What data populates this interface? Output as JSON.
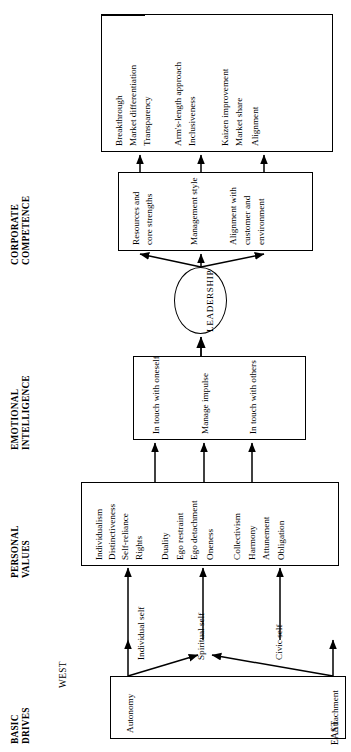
{
  "diagram": {
    "orientation": "rotated-90",
    "sections": [
      {
        "id": "corporate-competence",
        "label": "CORPORATE\nCOMPETENCE"
      },
      {
        "id": "emotional-intelligence",
        "label": "EMOTIONAL\nINTELLIGENCE"
      },
      {
        "id": "personal-values",
        "label": "PERSONAL\nVALUES"
      },
      {
        "id": "basic-drives",
        "label": "BASIC\nDRIVES"
      }
    ],
    "section_labels": {
      "corporate_competence_line1": "CORPORATE",
      "corporate_competence_line2": "COMPETENCE",
      "emotional_intelligence_line1": "EMOTIONAL",
      "emotional_intelligence_line2": "INTELLIGENCE",
      "personal_values_line1": "PERSONAL",
      "personal_values_line2": "VALUES",
      "basic_drives_line1": "BASIC",
      "basic_drives_line2": "DRIVES"
    },
    "orientation_labels": {
      "west": "WEST",
      "east": "EAST"
    },
    "outcomes_box": {
      "name": "corporate-outcomes",
      "items": [
        "Breakthrough",
        "Market differentiation",
        "Transparency",
        "Arm's-length approach",
        "Inclusiveness",
        "Kaizen improvement",
        "Market share",
        "Alignment"
      ]
    },
    "competence_box": {
      "name": "corporate-competence-drivers",
      "items": [
        "Resources and\ncore strengths",
        "Management style",
        "Alignment with\ncustomer and\nenvironment"
      ],
      "items_flat": [
        "Resources and core strengths",
        "Management style",
        "Alignment with customer and environment"
      ],
      "item_lines": {
        "resources_l1": "Resources and",
        "resources_l2": "core strengths",
        "management_style": "Management style",
        "alignment_l1": "Alignment with",
        "alignment_l2": "customer and",
        "alignment_l3": "environment"
      }
    },
    "leadership_node": {
      "name": "leadership",
      "label": "LEADERSHIP"
    },
    "emotional_intelligence_box": {
      "name": "emotional-intelligence-items",
      "items": [
        "In touch with oneself",
        "Manage impulse",
        "In touch with others"
      ]
    },
    "personal_values_box": {
      "name": "personal-values-items",
      "items": [
        "Individualism",
        "Distinctiveness",
        "Self-reliance",
        "Rights",
        "Duality",
        "Ego restraint",
        "Ego detachment",
        "Oneness",
        "Collectivism",
        "Harmony",
        "Attunement",
        "Obligation"
      ]
    },
    "self_labels": [
      "Individual self",
      "Spiritual self",
      "Civic self"
    ],
    "basic_drives_box": {
      "name": "basic-drives-items",
      "items": [
        "Autonomy",
        "Attachment"
      ]
    },
    "colors": {
      "stroke": "#000000",
      "background": "#ffffff",
      "text": "#000000"
    }
  }
}
